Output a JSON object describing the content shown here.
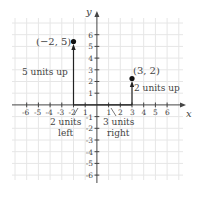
{
  "diagram": {
    "type": "coordinate-plane",
    "axes": {
      "x_label": "x",
      "y_label": "y",
      "x_ticks": [
        "-6",
        "-5",
        "-4",
        "-3",
        "-2",
        "1",
        "2",
        "3",
        "4",
        "5",
        "6"
      ],
      "y_ticks_pos": [
        "1",
        "2",
        "3",
        "4",
        "5",
        "6"
      ],
      "y_ticks_neg": [
        "-1",
        "-2",
        "-3",
        "-4",
        "-5",
        "-6"
      ],
      "x_range": [
        -6,
        6
      ],
      "y_range": [
        -6,
        6
      ]
    },
    "points": [
      {
        "label": "(−2, 5)",
        "x": -2,
        "y": 5
      },
      {
        "label": "(3, 2)",
        "x": 3,
        "y": 2
      }
    ],
    "annotations": {
      "up5": "5 units up",
      "up2": "2 units up",
      "left_1": "2 units",
      "left_2": "left",
      "right_1": "3 units",
      "right_2": "right"
    },
    "colors": {
      "grid": "#e4e4e4",
      "axis": "#444444",
      "text": "#555555",
      "point": "#111111"
    }
  }
}
